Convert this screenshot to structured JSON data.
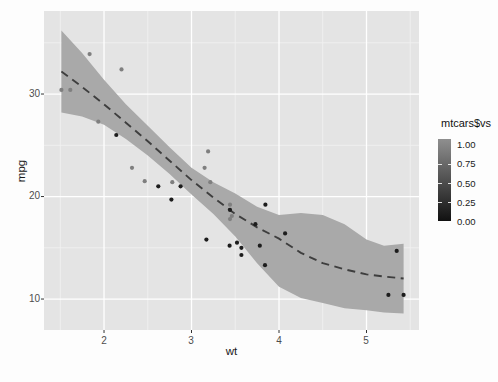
{
  "chart_data": {
    "type": "scatter",
    "title": "",
    "xlabel": "wt",
    "ylabel": "mpg",
    "xlim": [
      1.314,
      5.6
    ],
    "ylim": [
      6.98,
      38.1
    ],
    "grid": {
      "major": true,
      "minor": true
    },
    "panel_bg": "#e4e4e4",
    "grid_major_color": "#ffffff",
    "grid_minor_color": "#f1f1f1",
    "x_major_ticks": [
      {
        "v": 2,
        "label": "2"
      },
      {
        "v": 3,
        "label": "3"
      },
      {
        "v": 4,
        "label": "4"
      },
      {
        "v": 5,
        "label": "5"
      }
    ],
    "y_major_ticks": [
      {
        "v": 10,
        "label": "10"
      },
      {
        "v": 20,
        "label": "20"
      },
      {
        "v": 30,
        "label": "30"
      }
    ],
    "x_minor_ticks": [
      1.5,
      2.5,
      3.5,
      4.5,
      5.5
    ],
    "y_minor_ticks": [
      15,
      25,
      35
    ],
    "point_colors": {
      "vs0": "#1d1d1d",
      "vs1": "#7f7f7f"
    },
    "scatter_points_wt_mpg_vs": [
      [
        2.62,
        21.0,
        0
      ],
      [
        2.875,
        21.0,
        0
      ],
      [
        2.32,
        22.8,
        1
      ],
      [
        3.215,
        21.4,
        1
      ],
      [
        3.44,
        18.7,
        0
      ],
      [
        3.46,
        18.1,
        1
      ],
      [
        3.57,
        14.3,
        0
      ],
      [
        3.19,
        24.4,
        1
      ],
      [
        3.15,
        22.8,
        1
      ],
      [
        3.44,
        19.2,
        1
      ],
      [
        3.44,
        17.8,
        1
      ],
      [
        4.07,
        16.4,
        0
      ],
      [
        3.73,
        17.3,
        0
      ],
      [
        3.78,
        15.2,
        0
      ],
      [
        5.25,
        10.4,
        0
      ],
      [
        5.424,
        10.4,
        0
      ],
      [
        5.345,
        14.7,
        0
      ],
      [
        2.2,
        32.4,
        1
      ],
      [
        1.615,
        30.4,
        1
      ],
      [
        1.835,
        33.9,
        1
      ],
      [
        2.465,
        21.5,
        1
      ],
      [
        3.52,
        15.5,
        0
      ],
      [
        3.435,
        15.2,
        0
      ],
      [
        3.84,
        13.3,
        0
      ],
      [
        3.845,
        19.2,
        0
      ],
      [
        1.935,
        27.3,
        1
      ],
      [
        2.14,
        26.0,
        0
      ],
      [
        1.513,
        30.4,
        1
      ],
      [
        3.17,
        15.8,
        0
      ],
      [
        2.77,
        19.7,
        0
      ],
      [
        3.57,
        15.0,
        0
      ],
      [
        2.78,
        21.4,
        1
      ]
    ],
    "smooth_line": {
      "name": "loess-smooth",
      "style": "dashed",
      "color": "#3e3e3e",
      "points_wt_mpg": [
        [
          1.513,
          32.2
        ],
        [
          1.75,
          30.7
        ],
        [
          2.0,
          29.0
        ],
        [
          2.25,
          27.2
        ],
        [
          2.5,
          25.4
        ],
        [
          2.75,
          23.5
        ],
        [
          3.0,
          21.6
        ],
        [
          3.25,
          19.9
        ],
        [
          3.5,
          18.3
        ],
        [
          3.75,
          17.0
        ],
        [
          4.0,
          15.9
        ],
        [
          4.25,
          14.5
        ],
        [
          4.5,
          13.5
        ],
        [
          4.75,
          12.9
        ],
        [
          5.0,
          12.4
        ],
        [
          5.2,
          12.2
        ],
        [
          5.424,
          12.0
        ]
      ]
    },
    "confidence_ribbon": {
      "name": "loess-confidence-band",
      "color": "#a9a9a9",
      "points_wt_lower_upper": [
        [
          1.513,
          28.2,
          36.2
        ],
        [
          1.75,
          27.8,
          34.0
        ],
        [
          2.0,
          27.0,
          31.4
        ],
        [
          2.25,
          25.6,
          29.0
        ],
        [
          2.5,
          24.0,
          26.9
        ],
        [
          2.75,
          22.2,
          24.8
        ],
        [
          3.0,
          20.2,
          22.8
        ],
        [
          3.25,
          18.3,
          21.4
        ],
        [
          3.5,
          16.1,
          20.3
        ],
        [
          3.75,
          13.5,
          19.0
        ],
        [
          4.0,
          11.2,
          18.2
        ],
        [
          4.25,
          10.1,
          18.4
        ],
        [
          4.5,
          9.6,
          18.2
        ],
        [
          4.75,
          9.1,
          17.3
        ],
        [
          5.0,
          8.9,
          15.8
        ],
        [
          5.2,
          8.7,
          15.2
        ],
        [
          5.424,
          8.6,
          15.4
        ]
      ]
    },
    "legend": {
      "title": "mtcars$vs",
      "position": "right",
      "type": "colorbar-gradient",
      "color_high": "#8f8f8f",
      "color_low": "#111111",
      "labels": [
        {
          "v": 1.0,
          "label": "1.00"
        },
        {
          "v": 0.75,
          "label": "0.75"
        },
        {
          "v": 0.5,
          "label": "0.50"
        },
        {
          "v": 0.25,
          "label": "0.25"
        },
        {
          "v": 0.0,
          "label": "0.00"
        }
      ]
    }
  }
}
